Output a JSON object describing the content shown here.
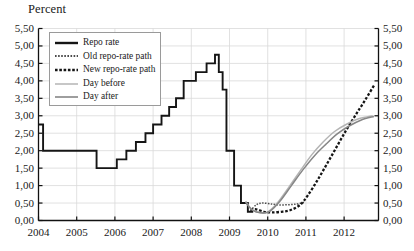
{
  "chart_data": {
    "type": "line",
    "title": "",
    "ylabel": "Percent",
    "xlabel": "",
    "ylim": [
      0,
      5.5
    ],
    "xlim": [
      2004.0,
      2012.9
    ],
    "grid": true,
    "y_ticks": [
      "0,00",
      "0,50",
      "1,00",
      "1,50",
      "2,00",
      "2,50",
      "3,00",
      "3,50",
      "4,00",
      "4,50",
      "5,00",
      "5,50"
    ],
    "y_tick_values": [
      0,
      0.5,
      1,
      1.5,
      2,
      2.5,
      3,
      3.5,
      4,
      4.5,
      5,
      5.5
    ],
    "x_ticks": [
      "2004",
      "2005",
      "2006",
      "2007",
      "2008",
      "2009",
      "2010",
      "2011",
      "2012"
    ],
    "x_tick_values": [
      2004,
      2005,
      2006,
      2007,
      2008,
      2009,
      2010,
      2011,
      2012
    ],
    "legend_position": "upper-left",
    "series": [
      {
        "name": "Repo rate",
        "style": "solid-thick-step",
        "color": "#151515",
        "points": [
          [
            2004.0,
            2.75
          ],
          [
            2004.12,
            2.75
          ],
          [
            2004.12,
            2.0
          ],
          [
            2005.52,
            2.0
          ],
          [
            2005.52,
            1.5
          ],
          [
            2006.0,
            1.5
          ],
          [
            2006.05,
            1.5
          ],
          [
            2006.05,
            1.75
          ],
          [
            2006.3,
            1.75
          ],
          [
            2006.3,
            2.0
          ],
          [
            2006.55,
            2.0
          ],
          [
            2006.55,
            2.25
          ],
          [
            2006.8,
            2.25
          ],
          [
            2006.8,
            2.5
          ],
          [
            2007.0,
            2.5
          ],
          [
            2007.0,
            2.75
          ],
          [
            2007.22,
            2.75
          ],
          [
            2007.22,
            3.0
          ],
          [
            2007.42,
            3.0
          ],
          [
            2007.42,
            3.25
          ],
          [
            2007.6,
            3.25
          ],
          [
            2007.6,
            3.5
          ],
          [
            2007.8,
            3.5
          ],
          [
            2007.8,
            4.0
          ],
          [
            2008.12,
            4.0
          ],
          [
            2008.12,
            4.25
          ],
          [
            2008.4,
            4.25
          ],
          [
            2008.4,
            4.5
          ],
          [
            2008.62,
            4.5
          ],
          [
            2008.62,
            4.75
          ],
          [
            2008.72,
            4.75
          ],
          [
            2008.72,
            4.25
          ],
          [
            2008.82,
            4.25
          ],
          [
            2008.82,
            3.75
          ],
          [
            2008.92,
            3.75
          ],
          [
            2008.92,
            2.0
          ],
          [
            2009.12,
            2.0
          ],
          [
            2009.12,
            1.0
          ],
          [
            2009.3,
            1.0
          ],
          [
            2009.3,
            0.5
          ],
          [
            2009.48,
            0.5
          ],
          [
            2009.48,
            0.25
          ],
          [
            2009.62,
            0.25
          ]
        ]
      },
      {
        "name": "Old repo-rate path",
        "style": "dotted-thin",
        "color": "#4a4a4a",
        "points": [
          [
            2009.55,
            0.28
          ],
          [
            2009.7,
            0.45
          ],
          [
            2009.85,
            0.5
          ],
          [
            2010.05,
            0.48
          ],
          [
            2010.25,
            0.45
          ],
          [
            2010.5,
            0.45
          ],
          [
            2010.75,
            0.47
          ],
          [
            2010.95,
            0.52
          ]
        ]
      },
      {
        "name": "New repo-rate path",
        "style": "dashed-thick",
        "color": "#151515",
        "points": [
          [
            2009.55,
            0.3
          ],
          [
            2009.7,
            0.32
          ],
          [
            2009.9,
            0.25
          ],
          [
            2010.1,
            0.23
          ],
          [
            2010.35,
            0.25
          ],
          [
            2010.6,
            0.3
          ],
          [
            2010.85,
            0.45
          ],
          [
            2011.05,
            0.72
          ],
          [
            2011.3,
            1.15
          ],
          [
            2011.55,
            1.62
          ],
          [
            2011.8,
            2.1
          ],
          [
            2012.05,
            2.58
          ],
          [
            2012.3,
            3.02
          ],
          [
            2012.55,
            3.45
          ],
          [
            2012.8,
            3.9
          ]
        ]
      },
      {
        "name": "Day before",
        "style": "solid-thin-light",
        "color": "#b4b4b4",
        "points": [
          [
            2009.42,
            0.55
          ],
          [
            2009.58,
            0.32
          ],
          [
            2009.8,
            0.22
          ],
          [
            2010.0,
            0.24
          ],
          [
            2010.25,
            0.5
          ],
          [
            2010.55,
            0.95
          ],
          [
            2010.85,
            1.42
          ],
          [
            2011.15,
            1.88
          ],
          [
            2011.45,
            2.25
          ],
          [
            2011.75,
            2.55
          ],
          [
            2012.05,
            2.75
          ],
          [
            2012.4,
            2.92
          ],
          [
            2012.75,
            3.0
          ]
        ]
      },
      {
        "name": "Day after",
        "style": "solid-thin-dark",
        "color": "#868686",
        "points": [
          [
            2009.42,
            0.52
          ],
          [
            2009.6,
            0.3
          ],
          [
            2009.82,
            0.22
          ],
          [
            2010.05,
            0.26
          ],
          [
            2010.32,
            0.55
          ],
          [
            2010.62,
            1.0
          ],
          [
            2010.92,
            1.45
          ],
          [
            2011.22,
            1.85
          ],
          [
            2011.52,
            2.18
          ],
          [
            2011.82,
            2.48
          ],
          [
            2012.12,
            2.7
          ],
          [
            2012.45,
            2.88
          ],
          [
            2012.78,
            2.98
          ]
        ]
      }
    ]
  },
  "legend": {
    "items": [
      {
        "label": "Repo rate",
        "swatch": "solid-thick-swatch"
      },
      {
        "label": "Old repo-rate path",
        "swatch": "dotted-thin-swatch"
      },
      {
        "label": "New repo-rate path",
        "swatch": "dashed-thick-swatch"
      },
      {
        "label": "Day before",
        "swatch": "solid-thin-light-swatch"
      },
      {
        "label": "Day after",
        "swatch": "solid-thin-dark-swatch"
      }
    ]
  },
  "colors": {
    "repo_rate": "#151515",
    "old_path": "#4a4a4a",
    "new_path": "#151515",
    "day_before": "#b4b4b4",
    "day_after": "#868686",
    "grid": "#d9d9d9",
    "axis": "#111111",
    "background": "#ffffff"
  }
}
